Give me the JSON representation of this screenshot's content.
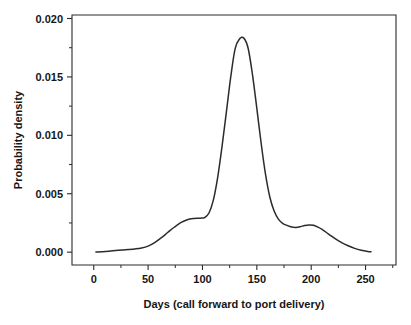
{
  "figure": {
    "background_color": "#ffffff",
    "line_color": "#2b2b2b",
    "text_color": "#161616",
    "cropped_title_fragment": ""
  },
  "axes": {
    "x": {
      "title": "Days (call forward to port delivery)",
      "tick_labels": [
        "0",
        "50",
        "100",
        "150",
        "200",
        "250"
      ],
      "tick_values": [
        0,
        50,
        100,
        150,
        200,
        250
      ],
      "minor_tick_values": [
        25,
        75,
        125,
        175,
        225,
        275
      ],
      "range": [
        -20,
        278
      ]
    },
    "y": {
      "title": "Probability density",
      "tick_labels": [
        "0.000",
        "0.005",
        "0.010",
        "0.015",
        "0.020"
      ],
      "tick_values": [
        0.0,
        0.005,
        0.01,
        0.015,
        0.02
      ],
      "minor_tick_values": [
        0.0025,
        0.0075,
        0.0125,
        0.0175
      ],
      "range": [
        -0.0011,
        0.0203
      ]
    }
  },
  "chart_data": {
    "type": "line",
    "title": "",
    "subtitle": "",
    "xlabel": "Days (call forward to port delivery)",
    "ylabel": "Probability density",
    "xlim": [
      -20,
      278
    ],
    "ylim": [
      -0.0011,
      0.0203
    ],
    "grid": false,
    "legend": null,
    "annotations": [],
    "series": [
      {
        "name": "Probability density",
        "color": "#2b2b2b",
        "x": [
          2,
          8,
          14,
          20,
          26,
          32,
          38,
          44,
          50,
          56,
          62,
          68,
          74,
          80,
          86,
          92,
          98,
          102,
          106,
          110,
          114,
          118,
          122,
          126,
          130,
          134,
          138,
          142,
          146,
          150,
          154,
          158,
          162,
          166,
          170,
          174,
          178,
          182,
          186,
          190,
          194,
          198,
          202,
          206,
          210,
          216,
          222,
          228,
          234,
          240,
          246,
          252,
          255
        ],
        "y": [
          2e-05,
          4e-05,
          8e-05,
          0.00014,
          0.00019,
          0.00023,
          0.00028,
          0.00036,
          0.00052,
          0.00082,
          0.00122,
          0.00168,
          0.00213,
          0.00252,
          0.00278,
          0.00288,
          0.00291,
          0.00296,
          0.00335,
          0.00445,
          0.0064,
          0.00905,
          0.012,
          0.015,
          0.0174,
          0.01825,
          0.01832,
          0.01745,
          0.0152,
          0.0123,
          0.0093,
          0.00665,
          0.0047,
          0.0035,
          0.0028,
          0.00245,
          0.00228,
          0.00215,
          0.00212,
          0.00218,
          0.00228,
          0.00233,
          0.0023,
          0.00215,
          0.00195,
          0.00155,
          0.00115,
          0.00082,
          0.00055,
          0.00032,
          0.00016,
          6e-05,
          4e-05
        ]
      }
    ],
    "features": {
      "peak_x": 138,
      "peak_y": 0.0183,
      "shoulder_plateau_x_range": [
        86,
        102
      ],
      "shoulder_plateau_y": 0.0029,
      "secondary_bump_x": 198,
      "secondary_bump_y": 0.0023,
      "curve_start_x": 2,
      "curve_end_x": 255
    }
  }
}
